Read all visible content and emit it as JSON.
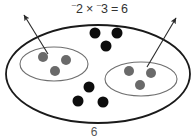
{
  "figure": {
    "equation": {
      "left_sign": "⁻",
      "left_factor": "2",
      "operator": "×",
      "right_sign": "⁻",
      "right_factor": "3",
      "equals": "=",
      "product": "6",
      "full_text": "⁻2 × ⁻3 = 6"
    },
    "total_label": "6",
    "outer_set": {
      "name": "universe-ellipse",
      "cx": 98,
      "cy": 74,
      "rx": 92,
      "ry": 49,
      "stroke": "#1a1a1a",
      "stroke_width": 1.8,
      "fill": "#ffffff"
    },
    "groups": [
      {
        "id": "group-left",
        "label": "removed group 1",
        "cx": 54,
        "cy": 64,
        "rx": 34,
        "ry": 17,
        "stroke": "#6f6f6f",
        "stroke_width": 1.1,
        "dot_color": "#6a6a6a",
        "dot_radius": 5,
        "dots": [
          {
            "cx": 43,
            "cy": 57
          },
          {
            "cx": 66,
            "cy": 60
          },
          {
            "cx": 55,
            "cy": 71
          }
        ],
        "arrow": {
          "name": "removal-arrow-left",
          "x1": 48,
          "y1": 54,
          "x2": 24,
          "y2": 15,
          "stroke": "#2a2a2a",
          "stroke_width": 1.1
        }
      },
      {
        "id": "group-right",
        "label": "removed group 2",
        "cx": 141,
        "cy": 79,
        "rx": 36,
        "ry": 17,
        "stroke": "#6f6f6f",
        "stroke_width": 1.1,
        "dot_color": "#6a6a6a",
        "dot_radius": 5,
        "dots": [
          {
            "cx": 129,
            "cy": 71
          },
          {
            "cx": 151,
            "cy": 73
          },
          {
            "cx": 140,
            "cy": 85
          }
        ],
        "arrow": {
          "name": "removal-arrow-right",
          "x1": 147,
          "y1": 67,
          "x2": 176,
          "y2": 18,
          "stroke": "#2a2a2a",
          "stroke_width": 1.1
        }
      }
    ],
    "free_dots": {
      "name": "product-counters",
      "color": "#0d0d0d",
      "radius": 5.5,
      "count": 6,
      "positions": [
        {
          "cx": 95,
          "cy": 33
        },
        {
          "cx": 117,
          "cy": 33
        },
        {
          "cx": 106,
          "cy": 46
        },
        {
          "cx": 89,
          "cy": 87
        },
        {
          "cx": 78,
          "cy": 101
        },
        {
          "cx": 103,
          "cy": 102
        }
      ]
    }
  }
}
